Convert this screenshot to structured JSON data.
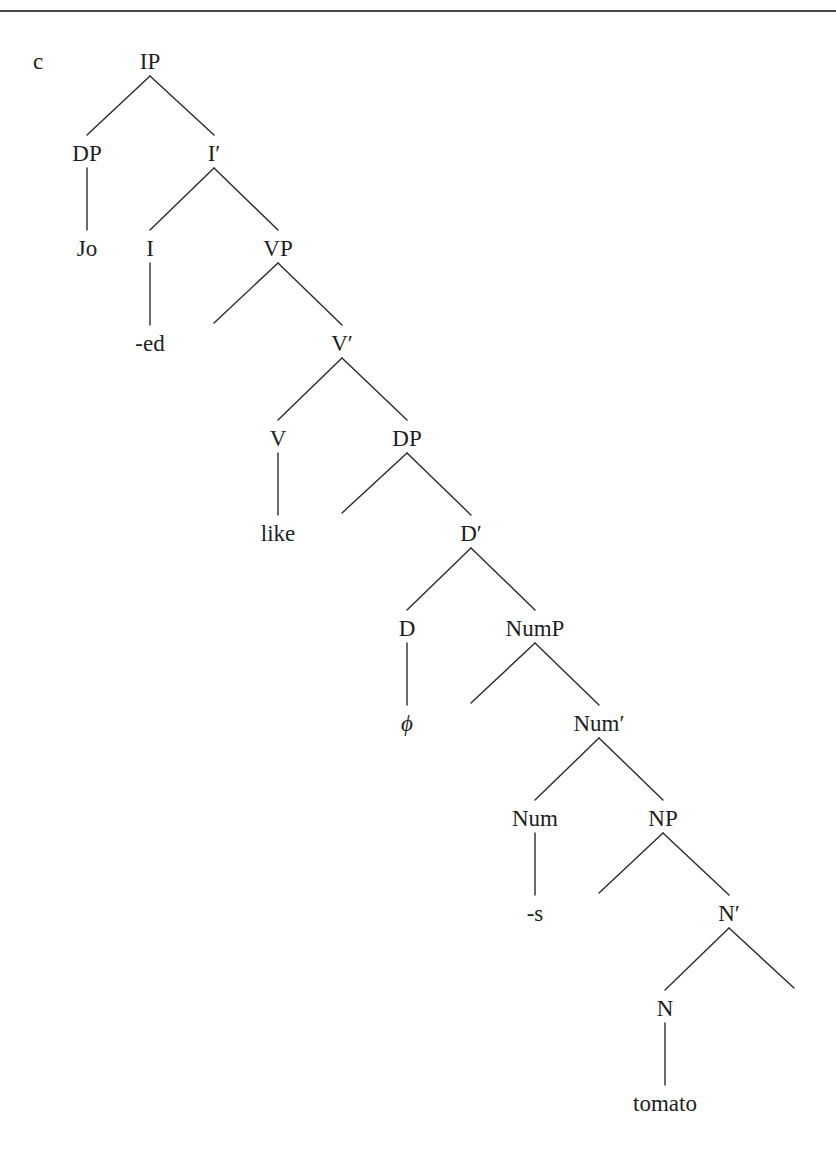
{
  "example_label": "c",
  "colors": {
    "line": "#2b2b2b",
    "text": "#1e1e1e",
    "rule": "#4a4a4a",
    "background": "#ffffff"
  },
  "nodes": [
    {
      "id": "IP",
      "label": "IP",
      "x": 150,
      "y": 61
    },
    {
      "id": "DP1",
      "label": "DP",
      "x": 87,
      "y": 153
    },
    {
      "id": "Ibar",
      "label": "I′",
      "x": 214,
      "y": 153
    },
    {
      "id": "Jo",
      "label": "Jo",
      "x": 87,
      "y": 248
    },
    {
      "id": "I",
      "label": "I",
      "x": 150,
      "y": 248
    },
    {
      "id": "VP",
      "label": "VP",
      "x": 278,
      "y": 248
    },
    {
      "id": "ed",
      "label": "-ed",
      "x": 150,
      "y": 343
    },
    {
      "id": "Vbar",
      "label": "V′",
      "x": 342,
      "y": 343
    },
    {
      "id": "V",
      "label": "V",
      "x": 278,
      "y": 438
    },
    {
      "id": "DP2",
      "label": "DP",
      "x": 407,
      "y": 438
    },
    {
      "id": "like",
      "label": "like",
      "x": 278,
      "y": 533
    },
    {
      "id": "Dbar",
      "label": "D′",
      "x": 471,
      "y": 533
    },
    {
      "id": "D",
      "label": "D",
      "x": 407,
      "y": 628
    },
    {
      "id": "NumP",
      "label": "NumP",
      "x": 535,
      "y": 628
    },
    {
      "id": "phi",
      "label": "ϕ",
      "x": 407,
      "y": 723,
      "italic": true
    },
    {
      "id": "Numbar",
      "label": "Num′",
      "x": 599,
      "y": 723
    },
    {
      "id": "Num",
      "label": "Num",
      "x": 535,
      "y": 818
    },
    {
      "id": "NP",
      "label": "NP",
      "x": 663,
      "y": 818
    },
    {
      "id": "s",
      "label": "-s",
      "x": 535,
      "y": 913
    },
    {
      "id": "Nbar",
      "label": "N′",
      "x": 729,
      "y": 913
    },
    {
      "id": "N",
      "label": "N",
      "x": 665,
      "y": 1008
    },
    {
      "id": "tomato",
      "label": "tomato",
      "x": 665,
      "y": 1103
    }
  ],
  "edges": [
    {
      "from": "IP",
      "to": "DP1"
    },
    {
      "from": "IP",
      "to": "Ibar"
    },
    {
      "from": "DP1",
      "to": "Jo"
    },
    {
      "from": "Ibar",
      "to": "I"
    },
    {
      "from": "Ibar",
      "to": "VP"
    },
    {
      "from": "I",
      "to": "ed"
    },
    {
      "from": "VP",
      "to": "_spec_VP",
      "empty": true,
      "x": 214,
      "y": 343
    },
    {
      "from": "VP",
      "to": "Vbar"
    },
    {
      "from": "Vbar",
      "to": "V"
    },
    {
      "from": "Vbar",
      "to": "DP2"
    },
    {
      "from": "V",
      "to": "like"
    },
    {
      "from": "DP2",
      "to": "_spec_DP",
      "empty": true,
      "x": 342,
      "y": 533
    },
    {
      "from": "DP2",
      "to": "Dbar"
    },
    {
      "from": "Dbar",
      "to": "D"
    },
    {
      "from": "Dbar",
      "to": "NumP"
    },
    {
      "from": "D",
      "to": "phi"
    },
    {
      "from": "NumP",
      "to": "_spec_NumP",
      "empty": true,
      "x": 471,
      "y": 723
    },
    {
      "from": "NumP",
      "to": "Numbar"
    },
    {
      "from": "Numbar",
      "to": "Num"
    },
    {
      "from": "Numbar",
      "to": "NP"
    },
    {
      "from": "Num",
      "to": "s"
    },
    {
      "from": "NP",
      "to": "_spec_NP",
      "empty": true,
      "x": 599,
      "y": 913
    },
    {
      "from": "NP",
      "to": "Nbar"
    },
    {
      "from": "Nbar",
      "to": "N"
    },
    {
      "from": "Nbar",
      "to": "_comp_N",
      "empty": true,
      "x": 794,
      "y": 1008
    },
    {
      "from": "N",
      "to": "tomato"
    }
  ]
}
